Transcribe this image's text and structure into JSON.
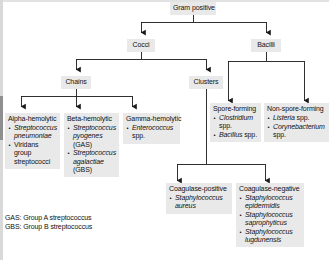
{
  "diagram": {
    "title": "Gram positive",
    "nodes": {
      "root": {
        "label": "Gram positive"
      },
      "cocci": {
        "label": "Cocci"
      },
      "bacilli": {
        "label": "Bacilli"
      },
      "chains": {
        "label": "Chains"
      },
      "clusters": {
        "label": "Clusters"
      },
      "alpha": {
        "label": "Alpha-hemolytic",
        "items": [
          [
            {
              "t": "Streptococcus",
              "i": true
            },
            {
              "t": " ",
              "i": false
            },
            {
              "t": "pneumoniae",
              "i": true
            }
          ],
          [
            {
              "t": "Viridans group streptococci",
              "i": false
            }
          ]
        ]
      },
      "beta": {
        "label": "Beta-hemolytic",
        "items": [
          [
            {
              "t": "Streptococcus",
              "i": true
            },
            {
              "t": " ",
              "i": false
            },
            {
              "t": "pyogenes",
              "i": true
            },
            {
              "t": " (GAS)",
              "i": false
            }
          ],
          [
            {
              "t": "Streptococcus",
              "i": true
            },
            {
              "t": " ",
              "i": false
            },
            {
              "t": "agalactiae",
              "i": true
            },
            {
              "t": " (GBS)",
              "i": false
            }
          ]
        ]
      },
      "gamma": {
        "label": "Gamma-hemolytic",
        "items": [
          [
            {
              "t": "Enterococcus",
              "i": true
            },
            {
              "t": " spp.",
              "i": false
            }
          ]
        ]
      },
      "spore_forming": {
        "label": "Spore-forming",
        "items": [
          [
            {
              "t": "Clostridium",
              "i": true
            },
            {
              "t": " spp.",
              "i": false
            }
          ],
          [
            {
              "t": "Bacillus",
              "i": true
            },
            {
              "t": " spp.",
              "i": false
            }
          ]
        ]
      },
      "non_spore_forming": {
        "label": "Non-spore-forming",
        "items": [
          [
            {
              "t": "Listeria",
              "i": true
            },
            {
              "t": " spp.",
              "i": false
            }
          ],
          [
            {
              "t": "Corynebacterium",
              "i": true
            },
            {
              "t": " spp.",
              "i": false
            }
          ]
        ]
      },
      "coagulase_positive": {
        "label": "Coagulase-positive",
        "items": [
          [
            {
              "t": "Staphylococcus",
              "i": true
            },
            {
              "t": " ",
              "i": false
            },
            {
              "t": "aureus",
              "i": true
            }
          ]
        ]
      },
      "coagulase_negative": {
        "label": "Coagulase-negative",
        "items": [
          [
            {
              "t": "Staphylococcus",
              "i": true
            },
            {
              "t": " ",
              "i": false
            },
            {
              "t": "epidermidis",
              "i": true
            }
          ],
          [
            {
              "t": "Staphylococcus",
              "i": true
            },
            {
              "t": " ",
              "i": false
            },
            {
              "t": "saprophyticus",
              "i": true
            }
          ],
          [
            {
              "t": "Staphylococcus",
              "i": true
            },
            {
              "t": " ",
              "i": false
            },
            {
              "t": "lugdunensis",
              "i": true
            }
          ]
        ]
      }
    },
    "legend": [
      "GAS: Group A streptococcus",
      "GBS: Group B streptococcus"
    ],
    "colors": {
      "node_fill": "#e9e9e9",
      "text": "#111111",
      "connector": "#1a1a1a",
      "background": "#ffffff"
    }
  }
}
